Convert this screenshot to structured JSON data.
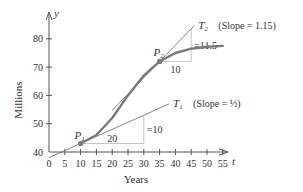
{
  "chart_data": {
    "type": "line",
    "title": "",
    "xlabel": "Years",
    "ylabel": "Millions",
    "x_axis_var": "t",
    "y_axis_var": "y",
    "xlim": [
      0,
      58
    ],
    "ylim": [
      40,
      85
    ],
    "x_ticks": [
      0,
      5,
      10,
      15,
      20,
      25,
      30,
      35,
      40,
      45,
      50,
      55
    ],
    "x_tick_labels": [
      "0",
      "5",
      "10",
      "15",
      "20",
      "25",
      "30",
      "35",
      "40",
      "45",
      "50",
      "55"
    ],
    "y_ticks": [
      40,
      50,
      60,
      70,
      80
    ],
    "y_tick_labels": [
      "40",
      "50",
      "60",
      "70",
      "80"
    ],
    "grid": false,
    "series": [
      {
        "name": "population curve",
        "color": "#7a7a7a",
        "x": [
          10,
          15,
          20,
          25,
          30,
          35,
          40,
          45,
          50,
          55
        ],
        "y": [
          43,
          46,
          52,
          60,
          67,
          72,
          75,
          76.5,
          77.2,
          77.5
        ]
      }
    ],
    "points": [
      {
        "label": "P1",
        "label_base": "P",
        "label_sub": "1",
        "x": 10,
        "y": 43
      },
      {
        "label": "P2",
        "label_base": "P",
        "label_sub": "2",
        "x": 35,
        "y": 72
      }
    ],
    "tangents": [
      {
        "label": "T1",
        "label_base": "T",
        "label_sub": "1",
        "slope": 0.5,
        "slope_text": "(Slope = ½)",
        "through": [
          10,
          43
        ],
        "x_range": [
          0,
          38
        ],
        "run": 20,
        "rise": 10,
        "run_label": "20",
        "rise_label": "=10"
      },
      {
        "label": "T2",
        "label_base": "T",
        "label_sub": "2",
        "slope": 1.15,
        "slope_text": "(Slope = 1.15)",
        "through": [
          35,
          72
        ],
        "x_range": [
          20,
          46
        ],
        "run": 10,
        "rise": 11.5,
        "run_label": "10",
        "rise_label": "=11.5"
      }
    ]
  }
}
